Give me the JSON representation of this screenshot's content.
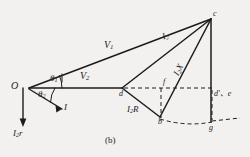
{
  "figure": {
    "caption": "(b)",
    "background_color": "#f2f1ef",
    "ink_color": "#1c1c1c",
    "type": "phasor-diagram"
  },
  "points": [
    {
      "id": "O",
      "label": "O",
      "x": 22,
      "y": 88
    },
    {
      "id": "c",
      "label": "c",
      "x": 213,
      "y": 17
    },
    {
      "id": "d",
      "label": "d",
      "x": 122,
      "y": 95
    },
    {
      "id": "b",
      "label": "b",
      "x": 160,
      "y": 119
    },
    {
      "id": "f",
      "label": "f",
      "x": 161,
      "y": 88
    },
    {
      "id": "g",
      "label": "g",
      "x": 213,
      "y": 124
    },
    {
      "id": "de",
      "label": "d'、e",
      "x": 215,
      "y": 97
    }
  ],
  "vector_labels": {
    "v1": {
      "base": "V",
      "sub": "1"
    },
    "v2": {
      "base": "V",
      "sub": "2"
    },
    "i": {
      "base": "I",
      "sub": ""
    },
    "i2": {
      "base": "I",
      "sub": "2"
    },
    "i2r_cap": {
      "base": "I",
      "sub": "2",
      "tail": "R"
    },
    "i2x": {
      "base": "I",
      "sub": "2",
      "tail": "X"
    },
    "i2r_low": {
      "base": "I",
      "sub": "2",
      "tail": "r"
    }
  },
  "angles": [
    {
      "id": "theta1",
      "base": "θ",
      "sub": "1"
    },
    {
      "id": "theta2",
      "base": "θ",
      "sub": "2"
    }
  ]
}
